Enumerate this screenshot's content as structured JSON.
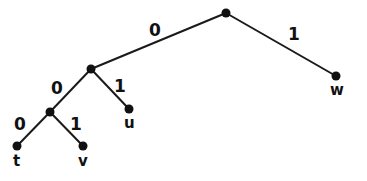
{
  "diagram": {
    "type": "binary-tree",
    "nodes": [
      {
        "id": "root",
        "x": 226,
        "y": 13
      },
      {
        "id": "n1",
        "x": 91,
        "y": 69
      },
      {
        "id": "w",
        "x": 336,
        "y": 76,
        "label": "w"
      },
      {
        "id": "n2",
        "x": 50,
        "y": 112
      },
      {
        "id": "u",
        "x": 129,
        "y": 109,
        "label": "u"
      },
      {
        "id": "t",
        "x": 17,
        "y": 146,
        "label": "t"
      },
      {
        "id": "v",
        "x": 83,
        "y": 146,
        "label": "v"
      }
    ],
    "edges": [
      {
        "from": "root",
        "to": "n1",
        "label": "0"
      },
      {
        "from": "root",
        "to": "w",
        "label": "1"
      },
      {
        "from": "n1",
        "to": "n2",
        "label": "0"
      },
      {
        "from": "n1",
        "to": "u",
        "label": "1"
      },
      {
        "from": "n2",
        "to": "t",
        "label": "0"
      },
      {
        "from": "n2",
        "to": "v",
        "label": "1"
      }
    ],
    "edge_labels": {
      "root_n1": "0",
      "root_w": "1",
      "n1_n2": "0",
      "n1_u": "1",
      "n2_t": "0",
      "n2_v": "1"
    },
    "leaf_labels": {
      "w": "w",
      "u": "u",
      "t": "t",
      "v": "v"
    }
  }
}
